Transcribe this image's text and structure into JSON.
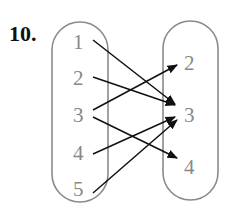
{
  "problem": {
    "number": "10."
  },
  "diagram": {
    "type": "mapping",
    "domain": [
      "1",
      "2",
      "3",
      "4",
      "5"
    ],
    "range": [
      "2",
      "3",
      "4"
    ],
    "arrows": [
      {
        "from": "1",
        "to": "3"
      },
      {
        "from": "2",
        "to": "3"
      },
      {
        "from": "3",
        "to": "2"
      },
      {
        "from": "3",
        "to": "4"
      },
      {
        "from": "4",
        "to": "3"
      },
      {
        "from": "5",
        "to": "3"
      }
    ],
    "colors": {
      "oval": "#8a8a8a",
      "text": "#888888",
      "arrow": "#111111"
    }
  }
}
